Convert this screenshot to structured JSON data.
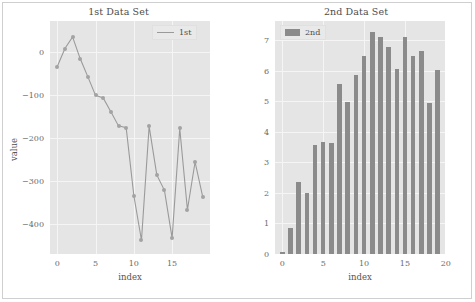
{
  "figure": {
    "width": 475,
    "height": 302,
    "background": "#ffffff",
    "axes_bg": "#e5e5e5",
    "grid_color": "#f5f5f5",
    "line_color": "#9a9a9a",
    "bar_color": "#8b8b8b"
  },
  "chart_data": [
    {
      "type": "line",
      "title": "1st Data Set",
      "xlabel": "index",
      "ylabel": "value",
      "legend": [
        "1st"
      ],
      "legend_position": "upper right",
      "grid": true,
      "xlim": [
        -0.95,
        19.95
      ],
      "ylim": [
        -470,
        72
      ],
      "xticks": [
        0,
        5,
        10,
        15
      ],
      "xtick_labels": [
        "0",
        "5",
        "10",
        "15"
      ],
      "yticks": [
        0,
        -100,
        -200,
        -300,
        -400
      ],
      "ytick_labels": [
        "0",
        "−100",
        "−200",
        "−300",
        "−400"
      ],
      "x": [
        0,
        1,
        2,
        3,
        4,
        5,
        6,
        7,
        8,
        9,
        10,
        11,
        12,
        13,
        14,
        15,
        16,
        17,
        18,
        19
      ],
      "series": [
        {
          "name": "1st",
          "values": [
            -34,
            8,
            35,
            -16,
            -58,
            -101,
            -107,
            -139,
            -172,
            -176,
            -334,
            -438,
            -173,
            -286,
            -322,
            -433,
            -178,
            -367,
            -256,
            -337,
            -225
          ]
        }
      ]
    },
    {
      "type": "bar",
      "title": "2nd Data Set",
      "xlabel": "index",
      "ylabel": "",
      "legend": [
        "2nd"
      ],
      "legend_position": "upper left",
      "grid": true,
      "xlim": [
        -0.9,
        19.9
      ],
      "ylim": [
        0,
        7.62
      ],
      "xticks": [
        0,
        5,
        10,
        15,
        20
      ],
      "xtick_labels": [
        "0",
        "5",
        "10",
        "15",
        "20"
      ],
      "yticks": [
        0,
        1,
        2,
        3,
        4,
        5,
        6,
        7
      ],
      "ytick_labels": [
        "0",
        "1",
        "2",
        "3",
        "4",
        "5",
        "6",
        "7"
      ],
      "categories": [
        0,
        1,
        2,
        3,
        4,
        5,
        6,
        7,
        8,
        9,
        10,
        11,
        12,
        13,
        14,
        15,
        16,
        17,
        18,
        19
      ],
      "values": [
        0.05,
        0.86,
        2.35,
        1.99,
        3.57,
        3.66,
        3.62,
        5.57,
        4.98,
        5.87,
        6.49,
        7.25,
        7.09,
        6.77,
        6.06,
        7.09,
        6.47,
        6.64,
        4.95,
        6.02
      ]
    }
  ]
}
